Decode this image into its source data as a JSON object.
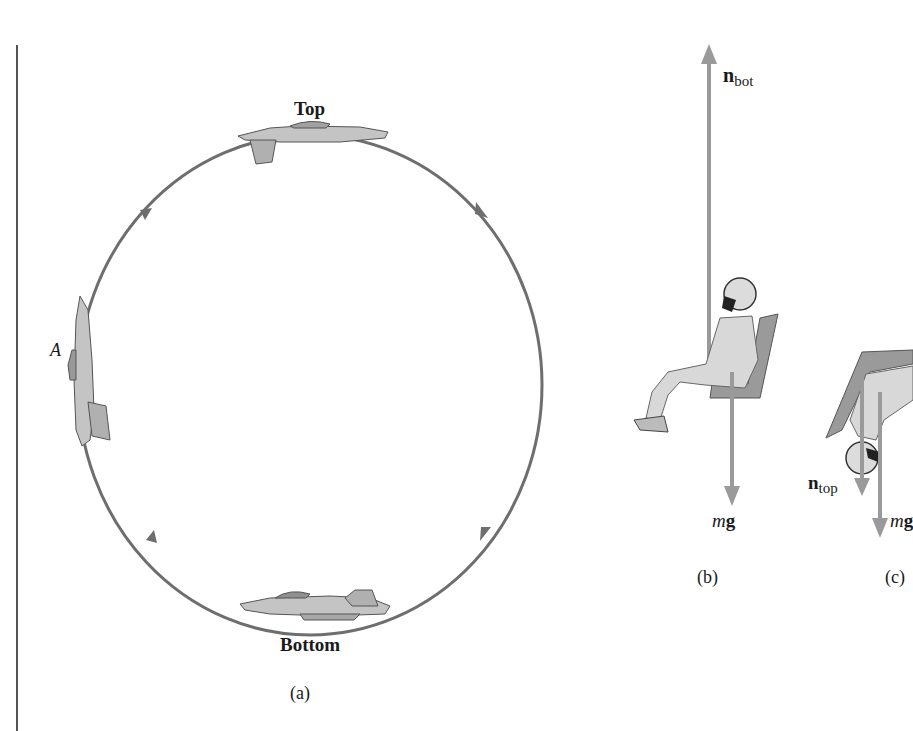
{
  "figure": {
    "panel_a": {
      "caption": "(a)",
      "label_top": "Top",
      "label_bottom": "Bottom",
      "label_point": "A",
      "loop": {
        "center_x": 310,
        "center_y": 385,
        "radius_x": 232,
        "radius_y": 250,
        "direction": "clockwise",
        "color": "#6e6e6e"
      }
    },
    "panel_b": {
      "caption": "(b)",
      "force_up": {
        "symbol": "n",
        "subscript": "bot"
      },
      "force_down": {
        "symbol_italic": "m",
        "symbol_bold": "g"
      }
    },
    "panel_c": {
      "caption": "(c)",
      "force_normal": {
        "symbol": "n",
        "subscript": "top"
      },
      "force_gravity": {
        "symbol_italic": "m",
        "symbol_bold": "g"
      }
    },
    "colors": {
      "arrow": "#9a9a9a",
      "loop": "#6e6e6e",
      "plane": "#b8b8b8",
      "seat": "#8c8c8c"
    }
  }
}
